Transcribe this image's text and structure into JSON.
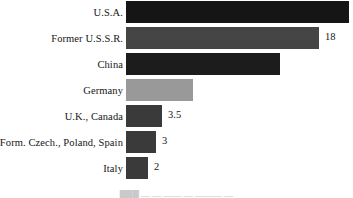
{
  "chart_data": {
    "type": "bar",
    "orientation": "horizontal",
    "title": "",
    "xlabel": "",
    "ylabel": "",
    "grid": false,
    "legend": null,
    "xlim": [
      0,
      28
    ],
    "categories": [
      "U.S.A.",
      "Former U.S.S.R.",
      "China",
      "Germany",
      "U.K., Canada",
      "Form. Czech., Poland, Spain",
      "Italy"
    ],
    "values": [
      28,
      24,
      19,
      8.5,
      3.5,
      3,
      2
    ],
    "value_labels": [
      "",
      "18",
      "",
      "",
      "3.5",
      "3",
      "2"
    ],
    "bar_colors": [
      "#151515",
      "#454545",
      "#1c1c1c",
      "#999999",
      "#3a3a3a",
      "#3a3a3a",
      "#3a3a3a"
    ],
    "bar_pixel_widths": [
      223,
      193,
      154,
      67,
      36,
      30,
      22
    ]
  },
  "caption": {
    "text": "███  —  —  ——  —  ———  —"
  },
  "colors": {
    "background": "#ffffff",
    "text": "#151515"
  }
}
